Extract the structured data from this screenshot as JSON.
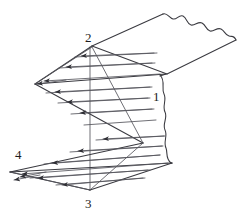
{
  "figure": {
    "kind": "engineering-line-diagram",
    "background_color": "#ffffff",
    "line_color": "#3a3a40",
    "thin_line_color": "#55555c",
    "arrow_color": "#2d2d33",
    "label_color": "#1c1c20",
    "canvas": {
      "width": 243,
      "height": 219
    },
    "labels": [
      {
        "id": "label-1",
        "text": "1",
        "x": 153,
        "y": 90
      },
      {
        "id": "label-2",
        "text": "2",
        "x": 85,
        "y": 33
      },
      {
        "id": "label-3",
        "text": "3",
        "x": 85,
        "y": 198
      },
      {
        "id": "label-4",
        "text": "4",
        "x": 16,
        "y": 150
      }
    ],
    "geometry": {
      "top_panel": {
        "name": "upper-plate",
        "corners": [
          [
            92,
            46
          ],
          [
            162,
            14
          ],
          [
            236,
            40
          ],
          [
            166,
            74
          ]
        ],
        "torn_edge": "top-right wavy break"
      },
      "upper_fold": {
        "name": "upper-zigzag-panel",
        "apex_left": [
          35,
          84
        ],
        "apex_top": [
          92,
          46
        ],
        "apex_right": [
          166,
          74
        ]
      },
      "lower_fold": {
        "name": "lower-zigzag-panel",
        "apex_left": [
          10,
          172
        ],
        "apex_bottom": [
          90,
          189
        ],
        "apex_right": [
          172,
          163
        ]
      },
      "break_line": {
        "name": "wavy-break-line",
        "from": [
          160,
          76
        ],
        "to": [
          170,
          163
        ]
      },
      "centerline": {
        "name": "vertical-center-line",
        "from": [
          90,
          46
        ],
        "to": [
          90,
          189
        ]
      }
    },
    "arrow_count": 18,
    "arrow_direction_upper": "leftward-toward-apex",
    "arrow_direction_lower": "leftward-toward-apex"
  }
}
